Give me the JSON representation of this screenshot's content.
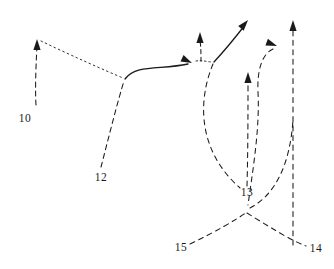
{
  "figure": {
    "title": "",
    "background_color": "#ffffff",
    "stroke_color": "#1a1a1a",
    "labels": [
      {
        "id": "label-10",
        "text": "10",
        "x": 25,
        "y": 118
      },
      {
        "id": "label-12",
        "text": "12",
        "x": 101,
        "y": 177
      },
      {
        "id": "label-13",
        "text": "13",
        "x": 247,
        "y": 192
      },
      {
        "id": "label-14",
        "text": "14",
        "x": 316,
        "y": 248
      },
      {
        "id": "label-15",
        "text": "15",
        "x": 181,
        "y": 247
      }
    ],
    "paths": {
      "branch_10": "M 36,105 C 35,90 36,62 37,47",
      "dotted_10_to_junction": "M 41,41 C 70,55 104,70 123,78",
      "branch_12": "M 101,167 C 108,140 118,100 124,81",
      "solid_main": "M 125,79 C 136,64 160,70 188,64",
      "dotted_short_mid": "M 196,61 C 202,60 208,62 212,62",
      "stem_arrow_up_mid": "M 201,61 C 201,55 201,48 200,40",
      "solid_diagonal": "M 214,62 C 226,49 238,34 245,25",
      "curve_left_lobe": "M 213,64 C 198,100 197,150 240,188",
      "vertical_13": "M 247,186 C 248,150 248,110 248,82",
      "curve_right_from_arrow": "M 273,49 C 262,54 257,70 258,92 C 260,130 252,175 248,205",
      "vertical_right": "M 293,245 C 293,180 293,100 293,28",
      "curve_15_to_cross": "M 190,244 C 215,232 236,220 247,212",
      "curve_cross_to_14": "M 247,213 C 268,226 290,240 306,246",
      "curve_right_lobe_up": "M 250,208 C 275,195 290,165 293,120"
    },
    "arrowheads": [
      {
        "id": "arrow-10-top",
        "x": 37,
        "y": 39,
        "angle": -90
      },
      {
        "id": "arrow-mid-left",
        "x": 192,
        "y": 63,
        "angle": 25
      },
      {
        "id": "arrow-mid-up",
        "x": 200,
        "y": 32,
        "angle": -90
      },
      {
        "id": "arrow-diagonal-top",
        "x": 248,
        "y": 20,
        "angle": -50
      },
      {
        "id": "arrow-13-up",
        "x": 248,
        "y": 72,
        "angle": -90
      },
      {
        "id": "arrow-right-curve",
        "x": 277,
        "y": 46,
        "angle": 20
      },
      {
        "id": "arrow-right-top",
        "x": 293,
        "y": 20,
        "angle": -90
      }
    ]
  }
}
